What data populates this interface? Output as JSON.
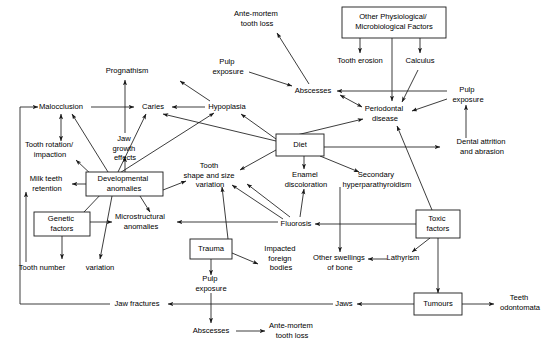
{
  "diagram": {
    "type": "flowchart",
    "stroke_color": "#1a1a1a",
    "background_color": "#ffffff",
    "nodes": [
      {
        "id": "malocclusion",
        "label": "Malocclusion",
        "shape": "plain",
        "x": 61,
        "y": 107,
        "lines": [
          "Malocclusion"
        ]
      },
      {
        "id": "prognathism",
        "label": "Prognathism",
        "shape": "plain",
        "x": 127,
        "y": 71,
        "lines": [
          "Prognathism"
        ]
      },
      {
        "id": "caries",
        "label": "Caries",
        "shape": "plain",
        "x": 153,
        "y": 107,
        "lines": [
          "Caries"
        ]
      },
      {
        "id": "hypoplasia",
        "label": "Hypoplasia",
        "shape": "plain",
        "x": 227,
        "y": 107,
        "lines": [
          "Hypoplasia"
        ]
      },
      {
        "id": "pulp-exposure-top",
        "label": "Pulp exposure",
        "shape": "plain",
        "x": 228,
        "y": 67,
        "lines": [
          "Pulp",
          "exposure"
        ]
      },
      {
        "id": "ante-mortem-top",
        "label": "Ante-mortem tooth loss",
        "shape": "plain",
        "x": 257,
        "y": 19,
        "lines": [
          "Ante-mortem",
          "tooth loss"
        ]
      },
      {
        "id": "abscesses-top",
        "label": "Abscesses",
        "shape": "plain",
        "x": 313,
        "y": 91,
        "lines": [
          "Abscesses"
        ]
      },
      {
        "id": "other-factors",
        "label": "Other Physiological/ Microbiological Factors",
        "shape": "box",
        "x": 394,
        "y": 22,
        "w": 104,
        "h": 30,
        "lines": [
          "Other Physiological/",
          "Microbiological Factors"
        ]
      },
      {
        "id": "tooth-erosion",
        "label": "Tooth erosion",
        "shape": "plain",
        "x": 360,
        "y": 61,
        "lines": [
          "Tooth erosion"
        ]
      },
      {
        "id": "calculus",
        "label": "Calculus",
        "shape": "plain",
        "x": 420,
        "y": 61,
        "lines": [
          "Calculus"
        ]
      },
      {
        "id": "periodontal-disease",
        "label": "Periodontal disease",
        "shape": "plain",
        "x": 385,
        "y": 114,
        "lines": [
          "Periodontal",
          "disease"
        ]
      },
      {
        "id": "pulp-exposure-right",
        "label": "Pulp exposure",
        "shape": "plain",
        "x": 466,
        "y": 95,
        "lines": [
          "Pulp",
          "exposure"
        ]
      },
      {
        "id": "dental-attrition",
        "label": "Dental attrition and abrasion",
        "shape": "plain",
        "x": 479,
        "y": 147,
        "lines": [
          "Dental attrition",
          "and abrasion"
        ]
      },
      {
        "id": "jaw-growth",
        "label": "Jaw growth effects",
        "shape": "plain",
        "x": 125,
        "y": 144,
        "lines": [
          "Jaw",
          "growth",
          "effects"
        ]
      },
      {
        "id": "tooth-rotation",
        "label": "Tooth rotation/ impaction",
        "shape": "plain",
        "x": 50,
        "y": 150,
        "lines": [
          "Tooth rotation/",
          "impaction"
        ]
      },
      {
        "id": "milk-teeth",
        "label": "Milk teeth retention",
        "shape": "plain",
        "x": 47,
        "y": 184,
        "lines": [
          "Milk teeth",
          "retention"
        ]
      },
      {
        "id": "developmental",
        "label": "Developmental anomalies",
        "shape": "box",
        "x": 124,
        "y": 184,
        "w": 76,
        "h": 24,
        "lines": [
          "Developmental",
          "anomalies"
        ]
      },
      {
        "id": "genetic-factors",
        "label": "Genetic factors",
        "shape": "box",
        "x": 62,
        "y": 224,
        "w": 56,
        "h": 24,
        "lines": [
          "Genetic",
          "factors"
        ]
      },
      {
        "id": "tooth-number",
        "label": "Tooth number",
        "shape": "plain",
        "x": 42,
        "y": 268,
        "lines": [
          "Tooth number"
        ]
      },
      {
        "id": "variation-left",
        "label": "variation",
        "shape": "plain",
        "x": 100,
        "y": 268,
        "lines": [
          "variation"
        ]
      },
      {
        "id": "microstructural",
        "label": "Microstructural anomalies",
        "shape": "plain",
        "x": 141,
        "y": 222,
        "lines": [
          "Microstructural",
          "anomalies"
        ]
      },
      {
        "id": "tooth-shape",
        "label": "Tooth shape and size variation",
        "shape": "plain",
        "x": 210,
        "y": 176,
        "lines": [
          "Tooth",
          "shape and size",
          "variation"
        ]
      },
      {
        "id": "diet",
        "label": "Diet",
        "shape": "box",
        "x": 300,
        "y": 145,
        "w": 48,
        "h": 22,
        "lines": [
          "Diet"
        ]
      },
      {
        "id": "enamel-discoloration",
        "label": "Enamel discoloration",
        "shape": "plain",
        "x": 306,
        "y": 178,
        "lines": [
          "Enamel",
          "discoloration"
        ]
      },
      {
        "id": "secondary-hyper",
        "label": "Secondary hyperparathyroidism",
        "shape": "plain",
        "x": 377,
        "y": 178,
        "lines": [
          "Secondary",
          "hyperparathyroidism"
        ]
      },
      {
        "id": "fluorosis",
        "label": "Fluorosis",
        "shape": "plain",
        "x": 296,
        "y": 224,
        "lines": [
          "Fluorosis"
        ]
      },
      {
        "id": "toxic-factors",
        "label": "Toxic factors",
        "shape": "box",
        "x": 438,
        "y": 224,
        "w": 44,
        "h": 28,
        "lines": [
          "Toxic",
          "factors"
        ]
      },
      {
        "id": "trauma",
        "label": "Trauma",
        "shape": "box",
        "x": 211,
        "y": 249,
        "w": 42,
        "h": 20,
        "lines": [
          "Trauma"
        ]
      },
      {
        "id": "impacted-bodies",
        "label": "Impacted foreign bodies",
        "shape": "plain",
        "x": 281,
        "y": 258,
        "lines": [
          "Impacted",
          "foreign",
          "bodies"
        ]
      },
      {
        "id": "other-swellings",
        "label": "Other swellings of bone",
        "shape": "plain",
        "x": 340,
        "y": 262,
        "lines": [
          "Other swellings",
          "of bone"
        ]
      },
      {
        "id": "lathyrism",
        "label": "Lathyrism",
        "shape": "plain",
        "x": 403,
        "y": 258,
        "lines": [
          "Lathyrism"
        ]
      },
      {
        "id": "pulp-exposure-bot",
        "label": "Pulp exposure",
        "shape": "plain",
        "x": 211,
        "y": 284,
        "lines": [
          "Pulp",
          "exposure"
        ]
      },
      {
        "id": "jaw-fractures",
        "label": "Jaw fractures",
        "shape": "plain",
        "x": 137,
        "y": 304,
        "lines": [
          "Jaw fractures"
        ]
      },
      {
        "id": "jaws",
        "label": "Jaws",
        "shape": "plain",
        "x": 344,
        "y": 304,
        "lines": [
          "Jaws"
        ]
      },
      {
        "id": "tumours",
        "label": "Tumours",
        "shape": "box",
        "x": 438,
        "y": 304,
        "w": 48,
        "h": 22,
        "lines": [
          "Tumours"
        ]
      },
      {
        "id": "teeth-odontomata",
        "label": "Teeth odontomata",
        "shape": "plain",
        "x": 520,
        "y": 302,
        "lines": [
          "Teeth",
          "odontomata"
        ]
      },
      {
        "id": "abscesses-bot",
        "label": "Abscesses",
        "shape": "plain",
        "x": 211,
        "y": 331,
        "lines": [
          "Abscesses"
        ]
      },
      {
        "id": "ante-mortem-bot",
        "label": "Ante-mortem tooth loss",
        "shape": "plain",
        "x": 290,
        "y": 330,
        "lines": [
          "Ante-mortem",
          "tooth loss"
        ]
      }
    ],
    "edges": [
      {
        "from": "malocclusion",
        "to": "caries"
      },
      {
        "from": "jaw-growth",
        "to": "prognathism"
      },
      {
        "from": "developmental",
        "to": "jaw-growth"
      },
      {
        "from": "developmental",
        "to": "malocclusion"
      },
      {
        "from": "developmental",
        "to": "tooth-rotation"
      },
      {
        "from": "developmental",
        "to": "milk-teeth"
      },
      {
        "from": "developmental",
        "to": "caries"
      },
      {
        "from": "developmental",
        "to": "hypoplasia"
      },
      {
        "from": "developmental",
        "to": "tooth-shape"
      },
      {
        "from": "developmental",
        "to": "microstructural"
      },
      {
        "from": "developmental",
        "to": "variation-left"
      },
      {
        "from": "malocclusion",
        "to": "tooth-rotation",
        "bidirectional": true
      },
      {
        "from": "genetic-factors",
        "to": "developmental"
      },
      {
        "from": "genetic-factors",
        "to": "microstructural"
      },
      {
        "from": "genetic-factors",
        "to": "tooth-number"
      },
      {
        "from": "tooth-number",
        "to": "milk-teeth"
      },
      {
        "from": "hypoplasia",
        "to": "caries"
      },
      {
        "from": "hypoplasia",
        "to": "pulp-exposure-top"
      },
      {
        "from": "pulp-exposure-top",
        "to": "abscesses-top"
      },
      {
        "from": "abscesses-top",
        "to": "ante-mortem-top"
      },
      {
        "from": "other-factors",
        "to": "tooth-erosion"
      },
      {
        "from": "other-factors",
        "to": "calculus"
      },
      {
        "from": "other-factors",
        "to": "periodontal-disease"
      },
      {
        "from": "calculus",
        "to": "periodontal-disease"
      },
      {
        "from": "periodontal-disease",
        "to": "abscesses-top",
        "bidirectional": true
      },
      {
        "from": "pulp-exposure-right",
        "to": "abscesses-top"
      },
      {
        "from": "pulp-exposure-right",
        "to": "periodontal-disease"
      },
      {
        "from": "dental-attrition",
        "to": "pulp-exposure-right"
      },
      {
        "from": "diet",
        "to": "periodontal-disease"
      },
      {
        "from": "diet",
        "to": "dental-attrition"
      },
      {
        "from": "diet",
        "to": "hypoplasia"
      },
      {
        "from": "diet",
        "to": "caries"
      },
      {
        "from": "diet",
        "to": "tooth-shape"
      },
      {
        "from": "diet",
        "to": "enamel-discoloration"
      },
      {
        "from": "diet",
        "to": "secondary-hyper"
      },
      {
        "from": "secondary-hyper",
        "to": "other-swellings"
      },
      {
        "from": "fluorosis",
        "to": "enamel-discoloration"
      },
      {
        "from": "fluorosis",
        "to": "tooth-shape"
      },
      {
        "from": "fluorosis",
        "to": "hypoplasia"
      },
      {
        "from": "fluorosis",
        "to": "microstructural"
      },
      {
        "from": "toxic-factors",
        "to": "fluorosis"
      },
      {
        "from": "toxic-factors",
        "to": "periodontal-disease"
      },
      {
        "from": "toxic-factors",
        "to": "lathyrism"
      },
      {
        "from": "toxic-factors",
        "to": "tumours"
      },
      {
        "from": "lathyrism",
        "to": "other-swellings"
      },
      {
        "from": "trauma",
        "to": "tooth-shape"
      },
      {
        "from": "trauma",
        "to": "impacted-bodies"
      },
      {
        "from": "trauma",
        "to": "pulp-exposure-bot"
      },
      {
        "from": "pulp-exposure-bot",
        "to": "abscesses-bot"
      },
      {
        "from": "abscesses-bot",
        "to": "ante-mortem-bot"
      },
      {
        "from": "jaws",
        "to": "jaw-fractures"
      },
      {
        "from": "tumours",
        "to": "jaws"
      },
      {
        "from": "tumours",
        "to": "teeth-odontomata"
      },
      {
        "from": "jaw-fractures",
        "to": "malocclusion",
        "routed": true
      }
    ]
  }
}
